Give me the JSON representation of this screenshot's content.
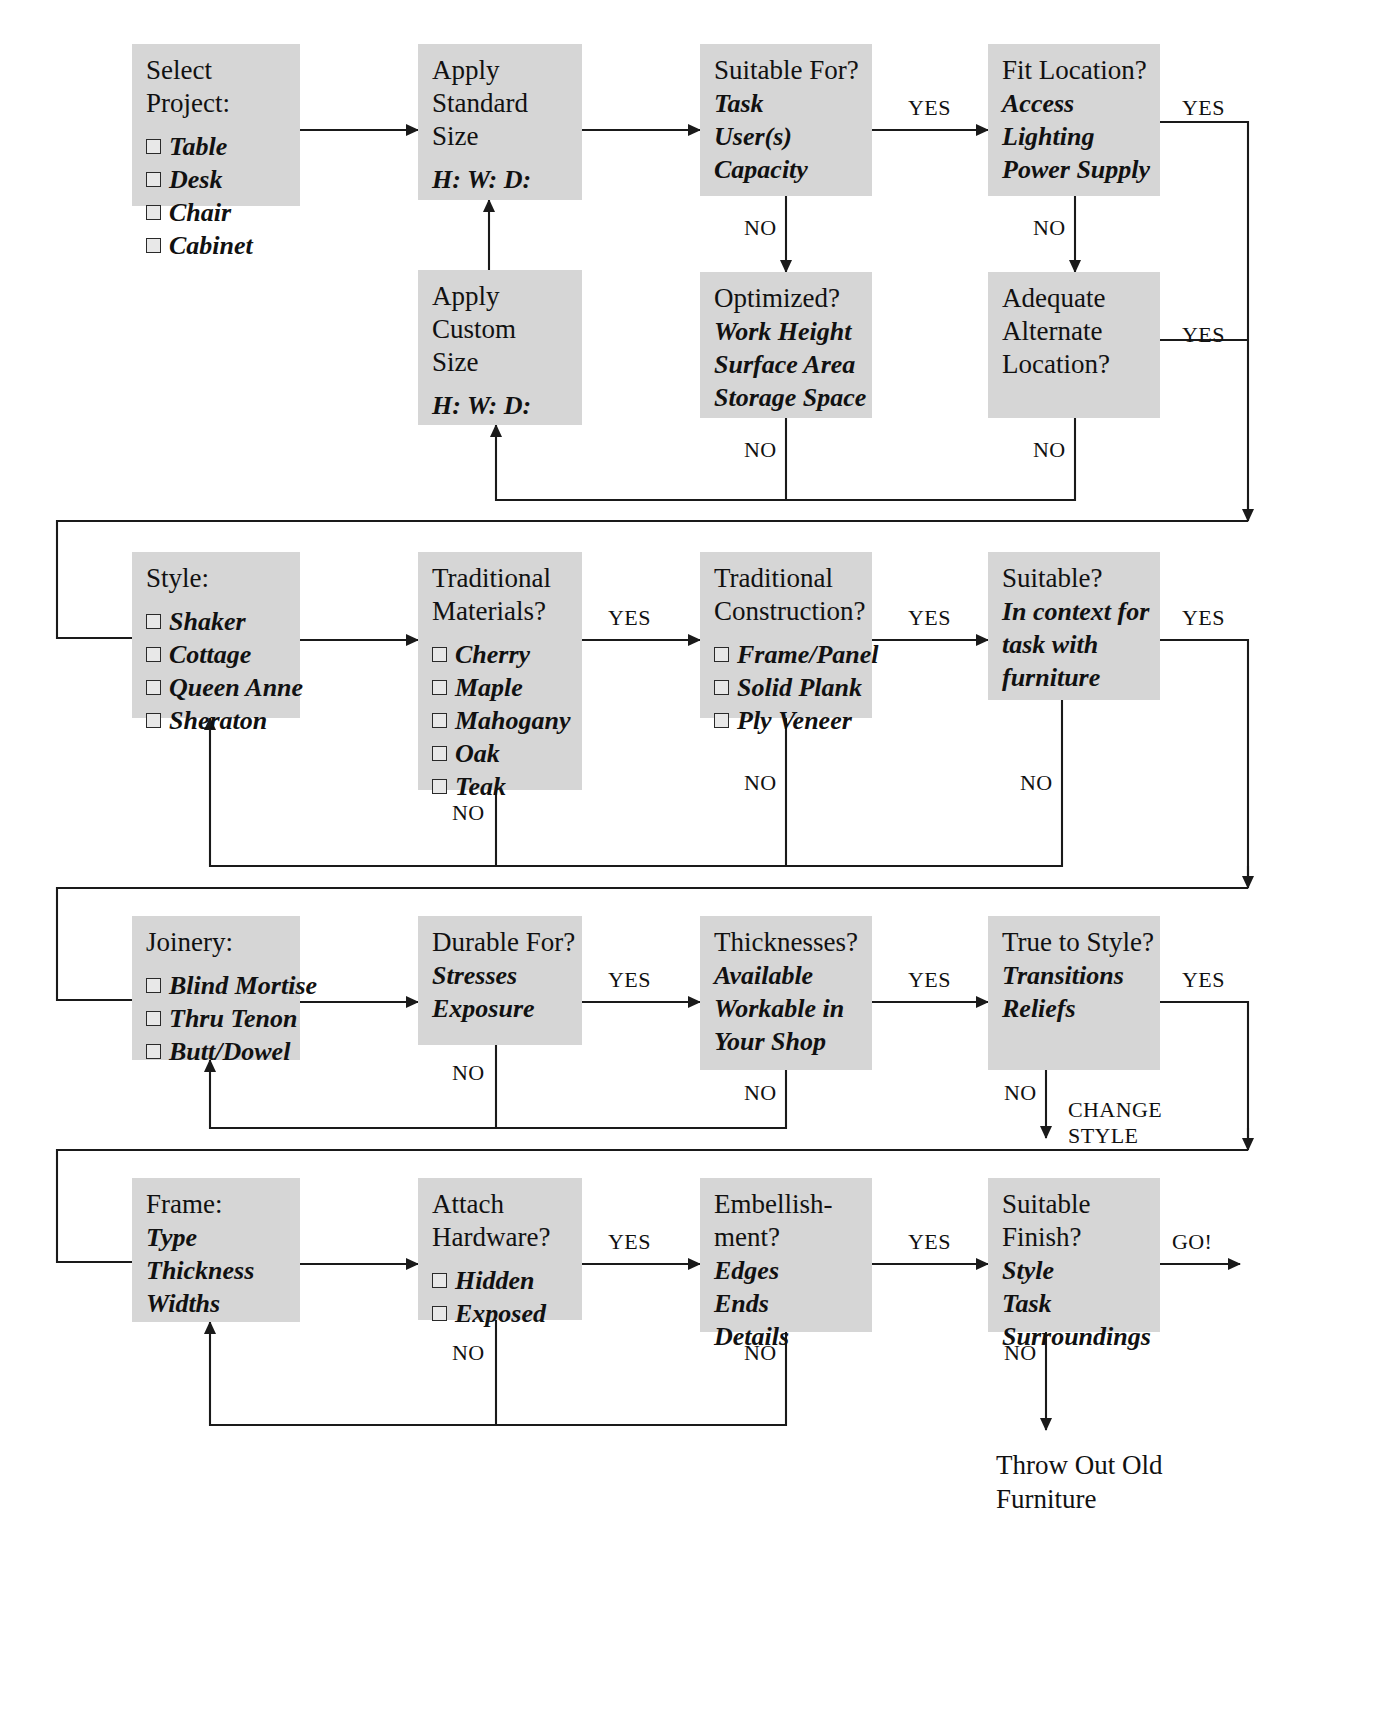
{
  "meta": {
    "title_fragment": "",
    "box_fill": "#d6d6d6",
    "line_color": "#1a1a1a"
  },
  "boxes": {
    "select_project": {
      "head": "Select Project:",
      "checks": [
        "Table",
        "Desk",
        "Chair",
        "Cabinet"
      ]
    },
    "apply_standard_size": {
      "head": "Apply Standard\nSize",
      "lines": [
        "H:  W:  D:"
      ]
    },
    "apply_custom_size": {
      "head": "Apply Custom\nSize",
      "lines": [
        "H:  W:  D:"
      ]
    },
    "suitable_for": {
      "head": "Suitable For?",
      "lines": [
        "Task",
        "User(s)",
        "Capacity"
      ]
    },
    "optimized": {
      "head": "Optimized?",
      "lines": [
        "Work Height",
        "Surface Area",
        "Storage Space"
      ]
    },
    "fit_location": {
      "head": "Fit Location?",
      "lines": [
        "Access",
        "Lighting",
        "Power Supply"
      ]
    },
    "adequate_alternate_location": {
      "head": "Adequate\nAlternate\nLocation?",
      "lines": []
    },
    "style": {
      "head": "Style:",
      "checks": [
        "Shaker",
        "Cottage",
        "Queen Anne",
        "Sheraton"
      ]
    },
    "traditional_materials": {
      "head": "Traditional\nMaterials?",
      "checks": [
        "Cherry",
        "Maple",
        "Mahogany",
        "Oak",
        "Teak"
      ]
    },
    "traditional_construction": {
      "head": "Traditional\nConstruction?",
      "checks": [
        "Frame/Panel",
        "Solid Plank",
        "Ply Veneer"
      ]
    },
    "suitable_context": {
      "head": "Suitable?",
      "lines": [
        "In context for",
        "task with",
        "furniture"
      ]
    },
    "joinery": {
      "head": "Joinery:",
      "checks": [
        "Blind Mortise",
        "Thru Tenon",
        "Butt/Dowel"
      ]
    },
    "durable_for": {
      "head": "Durable For?",
      "lines": [
        "Stresses",
        "Exposure"
      ]
    },
    "thicknesses": {
      "head": "Thicknesses?",
      "lines": [
        "Available",
        "Workable in",
        "Your Shop"
      ]
    },
    "true_to_style": {
      "head": "True to Style?",
      "lines": [
        "Transitions",
        "Reliefs"
      ]
    },
    "frame": {
      "head": "Frame:",
      "lines": [
        "Type",
        "Thickness",
        "Widths"
      ]
    },
    "attach_hardware": {
      "head": "Attach\nHardware?",
      "checks": [
        "Hidden",
        "Exposed"
      ]
    },
    "embellishment": {
      "head": "Embellish-\nment?",
      "lines": [
        "Edges",
        "Ends",
        "Details"
      ]
    },
    "suitable_finish": {
      "head": "Suitable\nFinish?",
      "lines": [
        "Style",
        "Task",
        "Surroundings"
      ]
    }
  },
  "edge_labels": {
    "yes_suitable_to_fit": "YES",
    "no_suitable_to_optimized": "NO",
    "yes_fit_to_row2": "YES",
    "no_fit_to_adequate": "NO",
    "no_optimized_down": "NO",
    "yes_adequate_right": "YES",
    "no_adequate_down": "NO",
    "yes_materials_to_construction": "YES",
    "no_materials_down": "NO",
    "yes_construction_to_suitable": "YES",
    "no_construction_down": "NO",
    "yes_suitable_right": "YES",
    "no_suitable_down": "NO",
    "yes_durable_to_thickness": "YES",
    "no_durable_down": "NO",
    "yes_thickness_to_true": "YES",
    "no_thickness_down": "NO",
    "yes_true_right": "YES",
    "no_true_down": "NO",
    "change_style": "CHANGE\nSTYLE",
    "yes_attach_to_embellish": "YES",
    "no_attach_down": "NO",
    "yes_embellish_to_finish": "YES",
    "no_embellish_down": "NO",
    "go": "GO!",
    "no_finish_down": "NO"
  },
  "terminals": {
    "throw_out": "Throw Out Old\nFurniture"
  }
}
